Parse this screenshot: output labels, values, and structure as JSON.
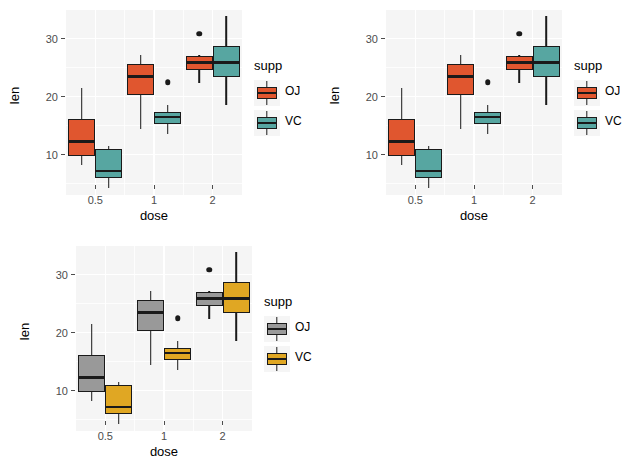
{
  "chart_data": [
    {
      "id": "panel-1",
      "type": "boxplot",
      "title": "",
      "xlabel": "dose",
      "ylabel": "len",
      "categories": [
        "0.5",
        "1",
        "2"
      ],
      "ylim": [
        3.0,
        35.0
      ],
      "yticks": [
        10,
        20,
        30
      ],
      "ytick_labels": [
        "10",
        "20",
        "30"
      ],
      "grid": true,
      "legend": {
        "title": "supp",
        "position": "right",
        "entries": [
          {
            "label": "OJ",
            "color": "#E0562F"
          },
          {
            "label": "VC",
            "color": "#57A6A1"
          }
        ]
      },
      "series": [
        {
          "name": "OJ",
          "color": "#E0562F",
          "boxes": [
            {
              "category": "0.5",
              "min": 8.2,
              "q1": 9.7,
              "median": 12.25,
              "q3": 16.2,
              "max": 21.5,
              "outliers": []
            },
            {
              "category": "1",
              "min": 14.5,
              "q1": 20.3,
              "median": 23.45,
              "q3": 25.65,
              "max": 27.3,
              "outliers": []
            },
            {
              "category": "2",
              "min": 22.4,
              "q1": 24.575,
              "median": 25.95,
              "q3": 27.075,
              "max": 27.3,
              "outliers": [
                30.9
              ]
            }
          ]
        },
        {
          "name": "VC",
          "color": "#57A6A1",
          "boxes": [
            {
              "category": "0.5",
              "min": 4.2,
              "q1": 5.95,
              "median": 7.15,
              "q3": 10.9,
              "max": 11.5,
              "outliers": []
            },
            {
              "category": "1",
              "min": 13.6,
              "q1": 15.275,
              "median": 16.5,
              "q3": 17.3,
              "max": 18.5,
              "outliers": [
                22.5
              ]
            },
            {
              "category": "2",
              "min": 18.5,
              "q1": 23.375,
              "median": 25.95,
              "q3": 28.8,
              "max": 33.9,
              "outliers": []
            }
          ]
        }
      ]
    },
    {
      "id": "panel-2",
      "type": "boxplot",
      "title": "",
      "xlabel": "dose",
      "ylabel": "len",
      "categories": [
        "0.5",
        "1",
        "2"
      ],
      "ylim": [
        3.0,
        35.0
      ],
      "yticks": [
        10,
        20,
        30
      ],
      "ytick_labels": [
        "10",
        "20",
        "30"
      ],
      "grid": true,
      "legend": {
        "title": "supp",
        "position": "right",
        "entries": [
          {
            "label": "OJ",
            "color": "#E0562F"
          },
          {
            "label": "VC",
            "color": "#57A6A1"
          }
        ]
      },
      "series": [
        {
          "name": "OJ",
          "color": "#E0562F",
          "boxes": [
            {
              "category": "0.5",
              "min": 8.2,
              "q1": 9.7,
              "median": 12.25,
              "q3": 16.2,
              "max": 21.5,
              "outliers": []
            },
            {
              "category": "1",
              "min": 14.5,
              "q1": 20.3,
              "median": 23.45,
              "q3": 25.65,
              "max": 27.3,
              "outliers": []
            },
            {
              "category": "2",
              "min": 22.4,
              "q1": 24.575,
              "median": 25.95,
              "q3": 27.075,
              "max": 27.3,
              "outliers": [
                30.9
              ]
            }
          ]
        },
        {
          "name": "VC",
          "color": "#57A6A1",
          "boxes": [
            {
              "category": "0.5",
              "min": 4.2,
              "q1": 5.95,
              "median": 7.15,
              "q3": 10.9,
              "max": 11.5,
              "outliers": []
            },
            {
              "category": "1",
              "min": 13.6,
              "q1": 15.275,
              "median": 16.5,
              "q3": 17.3,
              "max": 18.5,
              "outliers": [
                22.5
              ]
            },
            {
              "category": "2",
              "min": 18.5,
              "q1": 23.375,
              "median": 25.95,
              "q3": 28.8,
              "max": 33.9,
              "outliers": []
            }
          ]
        }
      ]
    },
    {
      "id": "panel-3",
      "type": "boxplot",
      "title": "",
      "xlabel": "dose",
      "ylabel": "len",
      "categories": [
        "0.5",
        "1",
        "2"
      ],
      "ylim": [
        3.0,
        35.0
      ],
      "yticks": [
        10,
        20,
        30
      ],
      "ytick_labels": [
        "10",
        "20",
        "30"
      ],
      "grid": true,
      "legend": {
        "title": "supp",
        "position": "right",
        "entries": [
          {
            "label": "OJ",
            "color": "#999999"
          },
          {
            "label": "VC",
            "color": "#E0A723"
          }
        ]
      },
      "series": [
        {
          "name": "OJ",
          "color": "#999999",
          "boxes": [
            {
              "category": "0.5",
              "min": 8.2,
              "q1": 9.7,
              "median": 12.25,
              "q3": 16.2,
              "max": 21.5,
              "outliers": []
            },
            {
              "category": "1",
              "min": 14.5,
              "q1": 20.3,
              "median": 23.45,
              "q3": 25.65,
              "max": 27.3,
              "outliers": []
            },
            {
              "category": "2",
              "min": 22.4,
              "q1": 24.575,
              "median": 25.95,
              "q3": 27.075,
              "max": 27.3,
              "outliers": [
                30.9
              ]
            }
          ]
        },
        {
          "name": "VC",
          "color": "#E0A723",
          "boxes": [
            {
              "category": "0.5",
              "min": 4.2,
              "q1": 5.95,
              "median": 7.15,
              "q3": 10.9,
              "max": 11.5,
              "outliers": []
            },
            {
              "category": "1",
              "min": 13.6,
              "q1": 15.275,
              "median": 16.5,
              "q3": 17.3,
              "max": 18.5,
              "outliers": [
                22.5
              ]
            },
            {
              "category": "2",
              "min": 18.5,
              "q1": 23.375,
              "median": 25.95,
              "q3": 28.8,
              "max": 33.9,
              "outliers": []
            }
          ]
        }
      ]
    }
  ],
  "style": {
    "panel_background": "#F5F5F5",
    "grid_color": "#FFFFFF",
    "axis_text_color": "#4D4D4D",
    "line_color": "#1A1A1A",
    "page_background": "#FFFFFF"
  }
}
